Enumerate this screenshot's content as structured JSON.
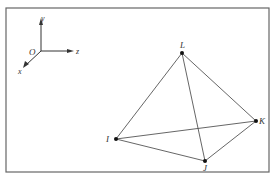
{
  "axes": {
    "origin_label": "O",
    "x_label": "x",
    "y_label": "y",
    "z_label": "z"
  },
  "points": {
    "L": {
      "label": "L",
      "x": 182,
      "y": 53
    },
    "K": {
      "label": "K",
      "x": 256,
      "y": 121
    },
    "I": {
      "label": "I",
      "x": 116,
      "y": 139
    },
    "J": {
      "label": "J",
      "x": 205,
      "y": 161
    }
  },
  "edges": [
    [
      "L",
      "I"
    ],
    [
      "L",
      "J"
    ],
    [
      "L",
      "K"
    ],
    [
      "I",
      "J"
    ],
    [
      "I",
      "K"
    ],
    [
      "J",
      "K"
    ]
  ],
  "colors": {
    "line": "#444444",
    "point": "#111111",
    "border": "#555555"
  }
}
